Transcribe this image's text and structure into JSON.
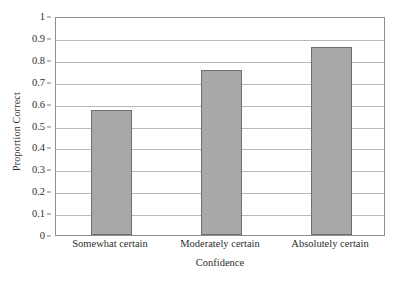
{
  "chart_data": {
    "type": "bar",
    "title": "",
    "subtitle": "",
    "xlabel": "Confidence",
    "ylabel": "Proportion Correct",
    "categories": [
      "Somewhat certain",
      "Moderately certain",
      "Absolutely certain"
    ],
    "values": [
      0.57,
      0.755,
      0.86
    ],
    "series": [
      {
        "name": "Proportion Correct",
        "values": [
          0.57,
          0.755,
          0.86
        ]
      }
    ],
    "ylim": [
      0,
      1
    ],
    "ytick_labels": [
      "0",
      "0.1",
      "0.2",
      "0.3",
      "0.4",
      "0.5",
      "0.6",
      "0.7",
      "0.8",
      "0.9",
      "1"
    ],
    "ytick_values": [
      0,
      0.1,
      0.2,
      0.3,
      0.4,
      0.5,
      0.6,
      0.7,
      0.8,
      0.9,
      1
    ],
    "grid": true,
    "grid_axis": "y",
    "legend": false,
    "legend_position": "none",
    "annotations": []
  },
  "style": {
    "bar_fill": "#a8a8a8",
    "bar_border": "#6f6f6f",
    "gridline_color": "#b9b9b9",
    "frame_color": "#8e8e8e",
    "background": "#ffffff",
    "text_color": "#2e2e2e"
  }
}
